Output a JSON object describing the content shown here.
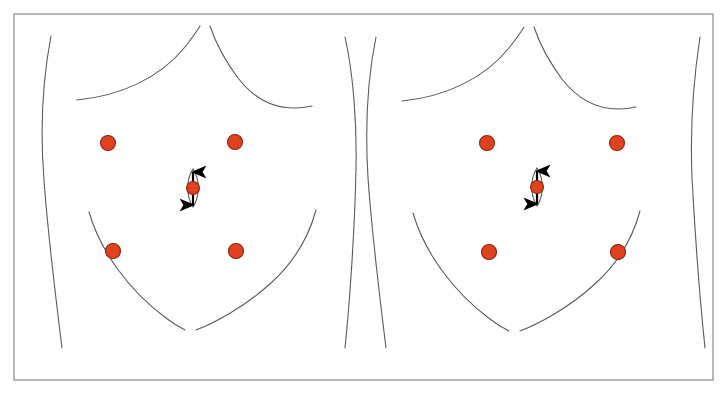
{
  "figure": {
    "panel_count": 2,
    "background_color": "#ffffff",
    "frame": {
      "name": "figure-border",
      "stroke_color": "#8a8a8a",
      "stroke_width": 1.2,
      "x": 14,
      "y": 14,
      "width": 699,
      "height": 366
    },
    "outline_stroke_color": "#5a5a5a",
    "outline_stroke_width": 1.1,
    "port_fill_color": "#e0411f",
    "port_stroke_color": "#8f2410",
    "arrow_color": "#000000",
    "lens_color": "#555555",
    "caption_text": ""
  },
  "panels": [
    {
      "id": "panel-left",
      "label": "Left abdominal outline",
      "ports": [
        {
          "id": "left-upper-left-port",
          "name": "Upper left quadrant port",
          "cx": 108,
          "cy": 143,
          "r": 7.5
        },
        {
          "id": "left-upper-right-port",
          "name": "Upper right quadrant port",
          "cx": 235,
          "cy": 142,
          "r": 7.5
        },
        {
          "id": "left-lower-left-port",
          "name": "Lower left quadrant port",
          "cx": 113,
          "cy": 251,
          "r": 7.5
        },
        {
          "id": "left-lower-right-port",
          "name": "Lower right quadrant port",
          "cx": 236,
          "cy": 251,
          "r": 7.5
        }
      ],
      "umbilical_port": {
        "id": "left-umbilical-port",
        "name": "Umbilical camera port",
        "cx": 193,
        "cy": 188,
        "r": 6.5,
        "arrow_top_y": 165,
        "arrow_bottom_y": 212,
        "lens_half_width": 7,
        "lens_half_height": 19
      }
    },
    {
      "id": "panel-right",
      "label": "Right abdominal outline",
      "ports": [
        {
          "id": "right-upper-left-port",
          "name": "Upper left quadrant port",
          "cx": 487,
          "cy": 143,
          "r": 7.5
        },
        {
          "id": "right-upper-right-port",
          "name": "Upper right quadrant port",
          "cx": 617,
          "cy": 143,
          "r": 7.5
        },
        {
          "id": "right-lower-left-port",
          "name": "Lower left quadrant port",
          "cx": 489,
          "cy": 252,
          "r": 7.5
        },
        {
          "id": "right-lower-right-port",
          "name": "Lower right quadrant port",
          "cx": 618,
          "cy": 252,
          "r": 7.5
        }
      ],
      "umbilical_port": {
        "id": "right-umbilical-port",
        "name": "Umbilical camera port",
        "cx": 537,
        "cy": 187,
        "r": 6.5,
        "arrow_top_y": 164,
        "arrow_bottom_y": 211,
        "lens_half_width": 7,
        "lens_half_height": 19
      }
    }
  ],
  "outlines": {
    "panel_left": {
      "flank_left": "M 51,36 C 43,78 40,130 44,180 C 48,236 56,300 62,348",
      "costal_left": "M 77,100 C 120,96 160,78 185,47 C 192,38 197,31 200,26",
      "costal_right": "M 210,26 C 214,38 223,58 238,78 C 258,104 284,112 312,106",
      "flank_right": "M 345,37 C 353,72 357,122 356,168 C 355,224 350,300 345,348",
      "inguinal_left": "M 89,212 C 100,250 128,290 166,318 C 175,325 181,328 185,330",
      "inguinal_right": "M 196,330 C 212,324 244,308 272,282 C 296,260 309,236 316,210"
    },
    "panel_right": {
      "flank_left": "M 376,37 C 368,76 365,128 368,178 C 372,234 380,300 386,348",
      "costal_left": "M 402,101 C 444,97 484,79 509,48 C 516,39 521,32 524,27",
      "costal_right": "M 534,27 C 538,39 547,59 562,79 C 582,105 608,113 636,107",
      "flank_right": "M 700,37 C 694,76 690,128 692,178 C 695,234 700,300 705,348",
      "inguinal_left": "M 413,213 C 424,251 452,291 490,319 C 499,326 505,329 509,331",
      "inguinal_right": "M 520,331 C 536,325 568,309 596,283 C 620,261 633,237 640,211"
    }
  }
}
